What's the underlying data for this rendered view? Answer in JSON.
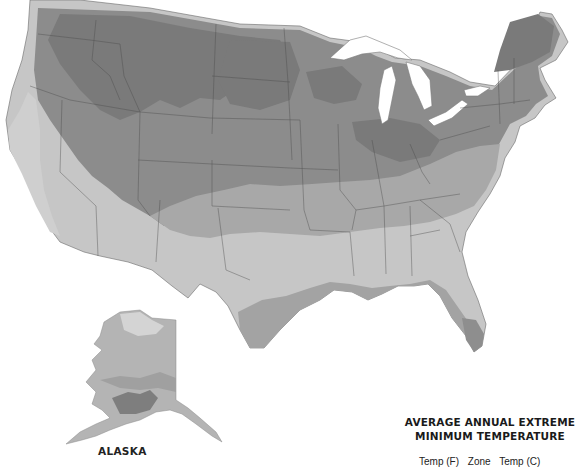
{
  "map": {
    "title_line1": "AVERAGE ANNUAL EXTREME",
    "title_line2": "MINIMUM TEMPERATURE",
    "legend_columns": [
      "Temp (F)",
      "Zone",
      "Temp (C)"
    ],
    "inset_label": "ALASKA",
    "colors": {
      "background": "#ffffff",
      "zone_coldest": "#7a7a7a",
      "zone_cold": "#8f8f8f",
      "zone_mid": "#a9a9a9",
      "zone_warm": "#c4c4c4",
      "zone_warmer": "#d3d3d3",
      "zone_coast": "#a2a2a2",
      "borders": "#4a4a4a",
      "water": "#ffffff"
    }
  }
}
